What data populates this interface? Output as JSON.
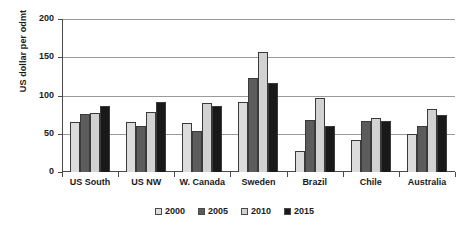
{
  "chart_data": {
    "type": "bar",
    "title": "",
    "xlabel": "",
    "ylabel": "US dollar per odmt",
    "ylim": [
      0,
      200
    ],
    "yticks": [
      0,
      50,
      100,
      150,
      200
    ],
    "grid": true,
    "legend_position": "bottom",
    "categories": [
      "US South",
      "US NW",
      "W. Canada",
      "Sweden",
      "Brazil",
      "Chile",
      "Australia"
    ],
    "series": [
      {
        "name": "2000",
        "color": "#dcdcdc",
        "values": [
          66,
          66,
          64,
          92,
          28,
          42,
          50
        ]
      },
      {
        "name": "2005",
        "color": "#5c5c5c",
        "values": [
          76,
          60,
          54,
          123,
          68,
          67,
          60
        ]
      },
      {
        "name": "2010",
        "color": "#d2d2d2",
        "values": [
          77,
          78,
          90,
          157,
          97,
          70,
          83
        ]
      },
      {
        "name": "2015",
        "color": "#191919",
        "values": [
          86,
          92,
          86,
          116,
          60,
          67,
          75
        ]
      }
    ]
  },
  "axis": {
    "y_title": "US dollar per odmt",
    "y_tick_labels": [
      "200",
      "150",
      "100",
      "50",
      "0"
    ]
  },
  "legend": {
    "items": [
      {
        "label": "2000",
        "color": "#dcdcdc"
      },
      {
        "label": "2005",
        "color": "#5c5c5c"
      },
      {
        "label": "2010",
        "color": "#d2d2d2"
      },
      {
        "label": "2015",
        "color": "#191919"
      }
    ]
  }
}
